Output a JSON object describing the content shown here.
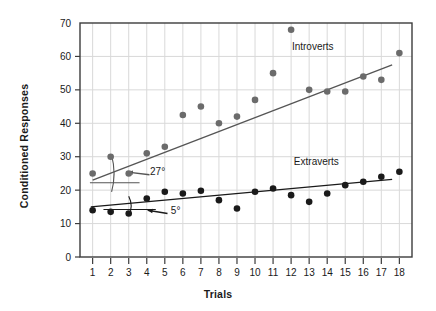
{
  "chart_data": {
    "type": "scatter",
    "title": "",
    "xlabel": "Trials",
    "ylabel": "Conditioned Responses",
    "xlim": [
      0.3,
      18.7
    ],
    "ylim": [
      0,
      70
    ],
    "yticks": [
      0,
      10,
      20,
      30,
      40,
      50,
      60,
      70
    ],
    "xticks": [
      1,
      2,
      3,
      4,
      5,
      6,
      7,
      8,
      9,
      10,
      11,
      12,
      13,
      14,
      15,
      16,
      17,
      18
    ],
    "grid": "both-light-gray",
    "legend_position": "inline-annotations",
    "x": [
      1,
      2,
      3,
      4,
      5,
      6,
      7,
      8,
      9,
      10,
      11,
      12,
      13,
      14,
      15,
      16,
      17,
      18
    ],
    "series": [
      {
        "name": "Introverts",
        "marker": "filled-circle",
        "color": "#6b6b6b",
        "values": [
          25,
          30,
          25,
          31,
          33,
          42.5,
          45,
          40,
          42,
          47,
          55,
          68,
          50,
          49.5,
          49.5,
          54,
          53,
          61
        ],
        "trendline": {
          "x1": 1,
          "y1": 23,
          "x2": 17.6,
          "y2": 57.5,
          "angle_label": "27°",
          "color": "#555555"
        }
      },
      {
        "name": "Extraverts",
        "marker": "filled-circle",
        "color": "#1a1a1a",
        "values": [
          14,
          13.5,
          13,
          17.5,
          19.5,
          19,
          19.8,
          17,
          14.5,
          19.5,
          20.5,
          18.5,
          16.5,
          19,
          21.5,
          22.5,
          24,
          25.5
        ],
        "trendline": {
          "x1": 0.9,
          "y1": 15,
          "x2": 17.6,
          "y2": 23.2,
          "angle_label": "5°",
          "color": "#1a1a1a"
        }
      }
    ],
    "annotations": [
      {
        "name": "introverts-label",
        "text": "Introverts",
        "x": 13.2,
        "y": 62
      },
      {
        "name": "extraverts-label",
        "text": "Extraverts",
        "x": 13.4,
        "y": 27.5
      },
      {
        "name": "introverts-angle",
        "text": "27°",
        "x": 4.6,
        "y": 24.5
      },
      {
        "name": "extraverts-angle",
        "text": "5°",
        "x": 5.6,
        "y": 12.8
      }
    ]
  },
  "axis": {
    "y_title": "Conditioned Responses",
    "x_title": "Trials",
    "y_tick_labels": [
      "0",
      "10",
      "20",
      "30",
      "40",
      "50",
      "60",
      "70"
    ],
    "x_tick_labels": [
      "1",
      "2",
      "3",
      "4",
      "5",
      "6",
      "7",
      "8",
      "9",
      "10",
      "11",
      "12",
      "13",
      "14",
      "15",
      "16",
      "17",
      "18"
    ]
  },
  "colors": {
    "introverts": "#6b6b6b",
    "extraverts": "#1a1a1a",
    "grid": "#d9d9d9",
    "frame": "#3c3c3c",
    "background": "#ffffff"
  }
}
